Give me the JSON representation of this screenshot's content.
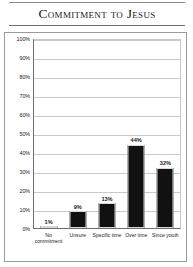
{
  "chart_data": {
    "type": "bar",
    "title": "Commitment to Jesus",
    "xlabel": "",
    "ylabel": "",
    "categories": [
      "No commitment",
      "Unsure",
      "Specific time",
      "Over time",
      "Since youth"
    ],
    "values": [
      1,
      9,
      13,
      44,
      32
    ],
    "value_labels": [
      "1%",
      "9%",
      "13%",
      "44%",
      "32%"
    ],
    "ylim": [
      0,
      100
    ],
    "ytick_labels": [
      "100%",
      "90%",
      "80%",
      "70%",
      "60%",
      "50%",
      "40%",
      "30%",
      "20%",
      "10%",
      "0%"
    ],
    "ytick_values": [
      100,
      90,
      80,
      70,
      60,
      50,
      40,
      30,
      20,
      10,
      0
    ],
    "grid": true,
    "legend": false,
    "bar_color": "#111111",
    "grid_color": "#c9c9c9",
    "axis_color": "#6e6e6e"
  }
}
